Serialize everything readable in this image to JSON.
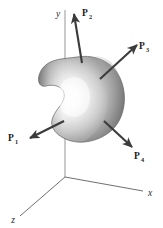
{
  "figure": {
    "width": 163,
    "height": 228,
    "background_color": "#ffffff"
  },
  "axes": {
    "origin": {
      "x": 65,
      "y": 177
    },
    "items": [
      {
        "name": "y-axis",
        "label": "y",
        "label_x": 58,
        "label_y": 17,
        "line": {
          "x1": 65,
          "y1": 177,
          "x2": 65,
          "y2": 10
        },
        "color": "#7a7a7a"
      },
      {
        "name": "x-axis",
        "label": "x",
        "label_x": 148,
        "label_y": 196,
        "line": {
          "x1": 65,
          "y1": 177,
          "x2": 143,
          "y2": 191
        },
        "color": "#4a4a4a"
      },
      {
        "name": "z-axis",
        "label": "z",
        "label_x": 13,
        "label_y": 222,
        "line": {
          "x1": 65,
          "y1": 177,
          "x2": 20,
          "y2": 216
        },
        "color": "#4a4a4a"
      }
    ]
  },
  "body": {
    "name": "rigid-body-blob",
    "description": "irregular kidney-shaped three-dimensional rigid body",
    "highlight_color": "#fdfdfd",
    "midtone_color": "#b9b9b9",
    "shadow_color": "#666666",
    "outline_color": "#5c5c5c"
  },
  "forces": [
    {
      "id": "P1",
      "label": "P",
      "subscript": "1",
      "label_x": 12,
      "label_y": 141,
      "tail": {
        "x": 64,
        "y": 121
      },
      "head": {
        "x": 29,
        "y": 138
      },
      "color": "#3b3b3b",
      "direction": "down-left"
    },
    {
      "id": "P2",
      "label": "P",
      "subscript": "2",
      "label_x": 80,
      "label_y": 16,
      "tail": {
        "x": 82,
        "y": 63
      },
      "head": {
        "x": 74,
        "y": 13
      },
      "color": "#3b3b3b",
      "direction": "up"
    },
    {
      "id": "P3",
      "label": "P",
      "subscript": "3",
      "label_x": 140,
      "label_y": 49,
      "tail": {
        "x": 100,
        "y": 79
      },
      "head": {
        "x": 137,
        "y": 44
      },
      "color": "#3b3b3b",
      "direction": "up-right"
    },
    {
      "id": "P4",
      "label": "P",
      "subscript": "4",
      "label_x": 135,
      "label_y": 158,
      "tail": {
        "x": 104,
        "y": 121
      },
      "head": {
        "x": 132,
        "y": 148
      },
      "color": "#3b3b3b",
      "direction": "down-right"
    }
  ]
}
